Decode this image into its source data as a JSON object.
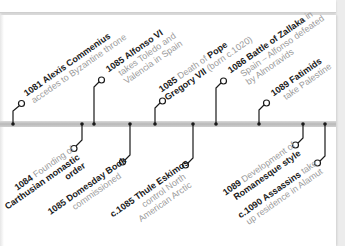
{
  "timeline": {
    "bar_color": "#bdbdbd",
    "line_color": "#1a1a1a",
    "events": [
      {
        "id": "e1081",
        "year": "1081",
        "title": "Alexis Commenius",
        "line1_rest": "",
        "line2": "accedes to Byzantine throne",
        "line3": "",
        "side": "above"
      },
      {
        "id": "e1084",
        "year": "1084",
        "title_pre": "Founding of",
        "line2": "Carthusian monastic",
        "line3": "order",
        "side": "below"
      },
      {
        "id": "e1085a",
        "year": "1085",
        "title": "Alfonso VI",
        "line2": "takes Toledo and",
        "line3": "Valencia in Spain",
        "side": "above"
      },
      {
        "id": "e1085b",
        "year": "1085",
        "title": "Domesday Book",
        "line2": "commissioned",
        "side": "below"
      },
      {
        "id": "e1085c",
        "year": "1085",
        "text1": "Death of",
        "title1": "Pope",
        "title2": "Gregory VII",
        "text2": "(born c.1020)",
        "side": "above"
      },
      {
        "id": "e1085d",
        "year": "c.1085",
        "title": "Thule Eskimos",
        "line2": "control North",
        "line3": "American Arctic",
        "side": "below"
      },
      {
        "id": "e1086",
        "year": "1086",
        "title": "Battle of Zallaka",
        "text1": "in",
        "line2": "Spain – Alfonso defeated",
        "line3": "by Almoravids",
        "side": "above"
      },
      {
        "id": "e1089a",
        "year": "1089",
        "title": "Fatimids",
        "line2": "take Palestine",
        "side": "above"
      },
      {
        "id": "e1089b",
        "year": "1089",
        "text1": "Development of",
        "title": "Romanesque style",
        "side": "below"
      },
      {
        "id": "e1090",
        "year": "c.1090",
        "title": "Assassins",
        "text1": "take",
        "line2": "up residence in Alamut",
        "side": "below"
      }
    ]
  }
}
